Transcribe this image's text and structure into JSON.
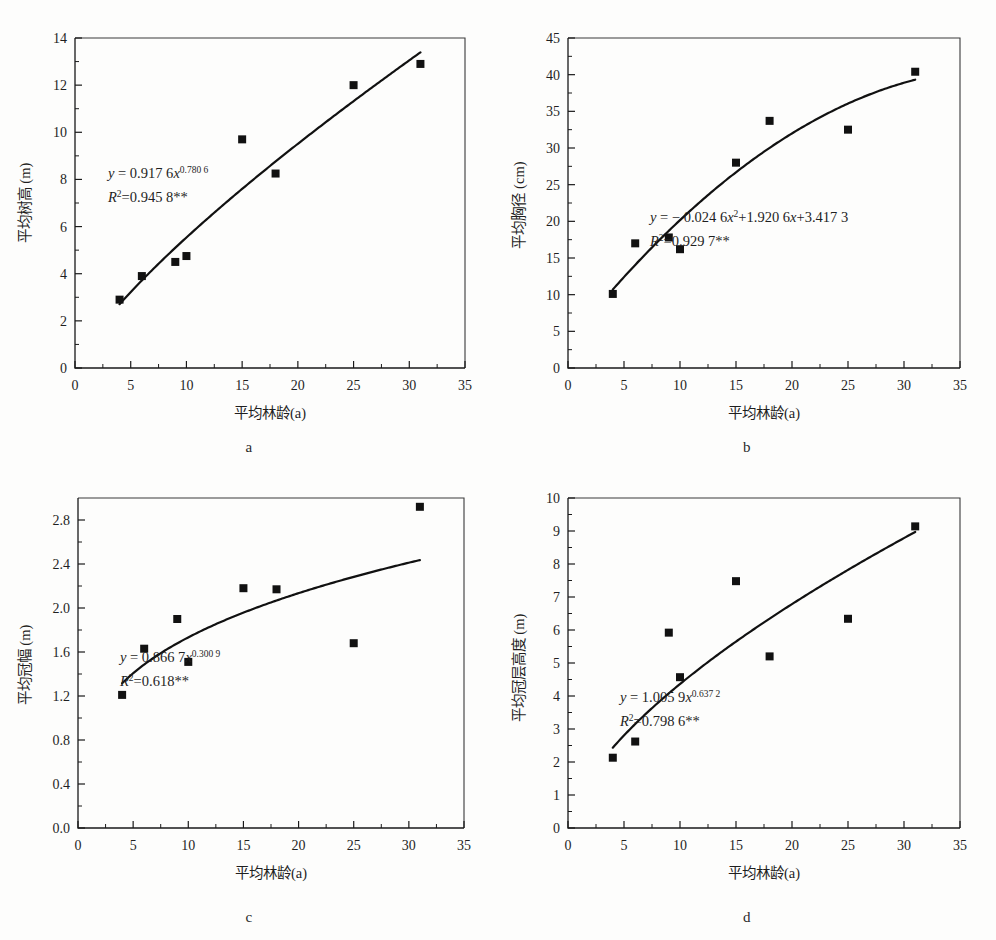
{
  "figure": {
    "panel_letters": [
      "a",
      "b",
      "c",
      "d"
    ],
    "caption_partial": ""
  },
  "chart_data": [
    {
      "type": "scatter",
      "panel": "a",
      "title": "",
      "xlabel": "平均林龄(a)",
      "ylabel": "平均树高 (m)",
      "xlim": [
        0,
        35
      ],
      "ylim": [
        0,
        14
      ],
      "xticks": [
        0,
        5,
        10,
        15,
        20,
        25,
        30,
        35
      ],
      "yticks": [
        0,
        2,
        4,
        6,
        8,
        10,
        12,
        14
      ],
      "xtick_labels": [
        "0",
        "5",
        "10",
        "15",
        "20",
        "25",
        "30",
        "35"
      ],
      "ytick_labels": [
        "0",
        "2",
        "4",
        "6",
        "8",
        "10",
        "12",
        "14"
      ],
      "grid": false,
      "legend": "none",
      "x": [
        4,
        6,
        9,
        10,
        15,
        18,
        25,
        31
      ],
      "y": [
        2.9,
        3.9,
        4.5,
        4.75,
        9.7,
        8.25,
        12.0,
        12.9
      ],
      "fit": {
        "kind": "power",
        "a": 0.9176,
        "b": 0.7806,
        "equation": "y = 0.917 6x",
        "exponent": "0.780 6",
        "r2_label": "R",
        "r2_text": "=0.945 8**",
        "r2_value": 0.9458,
        "domain": [
          4,
          31
        ]
      }
    },
    {
      "type": "scatter",
      "panel": "b",
      "title": "",
      "xlabel": "平均林龄(a)",
      "ylabel": "平均胸径 (cm)",
      "xlim": [
        0,
        35
      ],
      "ylim": [
        0,
        45
      ],
      "xticks": [
        0,
        5,
        10,
        15,
        20,
        25,
        30,
        35
      ],
      "yticks": [
        0,
        5,
        10,
        15,
        20,
        25,
        30,
        35,
        40,
        45
      ],
      "xtick_labels": [
        "0",
        "5",
        "10",
        "15",
        "20",
        "25",
        "30",
        "35"
      ],
      "ytick_labels": [
        "0",
        "5",
        "10",
        "15",
        "20",
        "25",
        "30",
        "35",
        "40",
        "45"
      ],
      "grid": false,
      "legend": "none",
      "x": [
        4,
        6,
        9,
        10,
        15,
        18,
        25,
        31
      ],
      "y": [
        10.1,
        17.0,
        17.8,
        16.2,
        28.0,
        33.7,
        32.5,
        40.4
      ],
      "fit": {
        "kind": "quadratic",
        "a": -0.0246,
        "b": 1.9206,
        "c": 3.4173,
        "equation_prefix": "y = − 0.024 6x",
        "equation_middle": "+1.920 6x+3.417 3",
        "exponent": "2",
        "r2_label": "R",
        "r2_text": "=0.929 7**",
        "r2_value": 0.9297,
        "domain": [
          4,
          31
        ]
      }
    },
    {
      "type": "scatter",
      "panel": "c",
      "title": "",
      "xlabel": "平均林龄(a)",
      "ylabel": "平均冠幅 (m)",
      "xlim": [
        0,
        35
      ],
      "ylim": [
        0,
        3.0
      ],
      "xticks": [
        0,
        5,
        10,
        15,
        20,
        25,
        30,
        35
      ],
      "yticks": [
        0.0,
        0.4,
        0.8,
        1.2,
        1.6,
        2.0,
        2.4,
        2.8
      ],
      "xtick_labels": [
        "0",
        "5",
        "10",
        "15",
        "20",
        "25",
        "30",
        "35"
      ],
      "ytick_labels": [
        "0.0",
        "0.4",
        "0.8",
        "1.2",
        "1.6",
        "2.0",
        "2.4",
        "2.8"
      ],
      "grid": false,
      "legend": "none",
      "x": [
        4,
        6,
        9,
        10,
        15,
        18,
        25,
        31
      ],
      "y": [
        1.21,
        1.63,
        1.9,
        1.51,
        2.18,
        2.17,
        1.68,
        2.92
      ],
      "fit": {
        "kind": "power",
        "a": 0.8667,
        "b": 0.3009,
        "equation": "y = 0.866 7x",
        "exponent": "0.300 9",
        "r2_label": "R",
        "r2_text": "=0.618**",
        "r2_value": 0.618,
        "domain": [
          4,
          31
        ]
      }
    },
    {
      "type": "scatter",
      "panel": "d",
      "title": "",
      "xlabel": "平均林龄(a)",
      "ylabel": "平均冠层高度 (m)",
      "xlim": [
        0,
        35
      ],
      "ylim": [
        0,
        10
      ],
      "xticks": [
        0,
        5,
        10,
        15,
        20,
        25,
        30,
        35
      ],
      "yticks": [
        0,
        1,
        2,
        3,
        4,
        5,
        6,
        7,
        8,
        9,
        10
      ],
      "xtick_labels": [
        "0",
        "5",
        "10",
        "15",
        "20",
        "25",
        "30",
        "35"
      ],
      "ytick_labels": [
        "0",
        "1",
        "2",
        "3",
        "4",
        "5",
        "6",
        "7",
        "8",
        "9",
        "10"
      ],
      "grid": false,
      "legend": "none",
      "x": [
        4,
        6,
        9,
        10,
        15,
        18,
        25,
        31
      ],
      "y": [
        2.13,
        2.62,
        5.92,
        4.57,
        7.48,
        5.2,
        6.34,
        9.14
      ],
      "fit": {
        "kind": "power",
        "a": 1.0059,
        "b": 0.6372,
        "equation": "y = 1.005 9x",
        "exponent": "0.637 2",
        "r2_label": "R",
        "r2_text": "=0.798 6**",
        "r2_value": 0.7986,
        "domain": [
          4,
          31
        ]
      }
    }
  ]
}
